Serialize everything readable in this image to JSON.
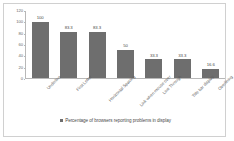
{
  "chart_data": {
    "type": "bar",
    "title": "",
    "subtitle": "",
    "xlabel": "",
    "ylabel": "",
    "categories": [
      "Underline",
      "First Letter",
      "Horizontal Spacing",
      "Link when mouse over",
      "Line Through",
      "Title bar display",
      "Overlining"
    ],
    "values": [
      100,
      83.3,
      83.3,
      50,
      33.3,
      33.3,
      16.6
    ],
    "value_labels": [
      "100",
      "83.3",
      "83.3",
      "50",
      "33.3",
      "33.3",
      "16.6"
    ],
    "series": [
      {
        "name": "Percentage of browsers reporting problems in display",
        "values": [
          100,
          83.3,
          83.3,
          50,
          33.3,
          33.3,
          16.6
        ]
      }
    ],
    "ylim": [
      0,
      120
    ],
    "y_ticks": [
      0,
      20,
      40,
      60,
      80,
      100,
      120
    ],
    "y_tick_labels": [
      "0",
      "20",
      "40",
      "60",
      "80",
      "100",
      "120"
    ],
    "grid": false,
    "legend_position": "bottom",
    "bar_color": "#6e6e6e",
    "axis_color": "#b8b8b8",
    "border_color": "#d0d0d0"
  },
  "legend": {
    "marker": "square-marker",
    "label": "Percentage of browsers reporting problems in display"
  }
}
